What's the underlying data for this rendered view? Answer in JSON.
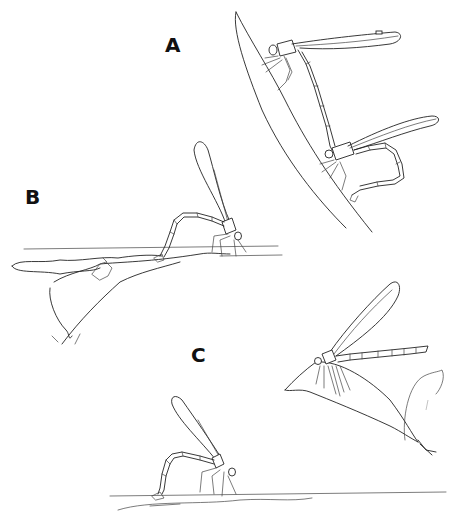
{
  "figure": {
    "panels": [
      {
        "id": "A",
        "label": "A",
        "content": "tandem pair perched on a grass stem"
      },
      {
        "id": "B",
        "label": "B",
        "content": "damselfly ovipositing on a floating branch"
      },
      {
        "id": "C",
        "label": "C",
        "content": "damselfly ovipositing at water surface and one perched on a leaf"
      }
    ]
  },
  "colors": {
    "background": "#ffffff",
    "ink": "#222222"
  }
}
